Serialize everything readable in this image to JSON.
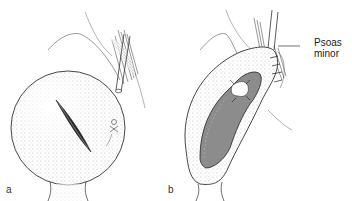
{
  "figure": {
    "panels": [
      {
        "id": "a",
        "label": "a",
        "description": "Bladder with oblique incision, ureter and fixation suture"
      },
      {
        "id": "b",
        "label": "b",
        "description": "Opened bladder stretched toward psoas minor tendon with sutures"
      }
    ],
    "callouts": [
      {
        "text_line1": "Psoas",
        "text_line2": "minor"
      }
    ],
    "colors": {
      "line": "#2a2a2a",
      "stipple": "#9a9a9a",
      "lumen": "#8c8c8c",
      "background": "#ffffff"
    }
  }
}
